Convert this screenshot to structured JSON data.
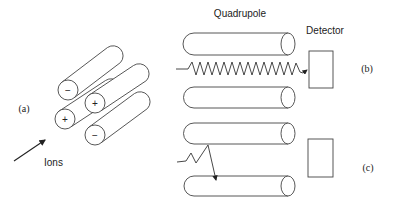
{
  "labels": {
    "quadrupole": "Quadrupole",
    "detector": "Detector",
    "ions": "Ions",
    "panel_a": "(a)",
    "panel_b": "(b)",
    "panel_c": "(c)"
  },
  "rods_3d": [
    {
      "sign": "−",
      "front": [
        68,
        90
      ],
      "back": [
        114,
        55
      ]
    },
    {
      "sign": "+",
      "front": [
        95,
        103
      ],
      "back": [
        140,
        73
      ]
    },
    {
      "sign": "+",
      "front": [
        65,
        119
      ],
      "back": [
        112,
        88
      ]
    },
    {
      "sign": "−",
      "front": [
        95,
        135
      ],
      "back": [
        141,
        101
      ]
    }
  ],
  "colors": {
    "stroke": "#333333",
    "text": "#222222",
    "background": "#ffffff"
  }
}
